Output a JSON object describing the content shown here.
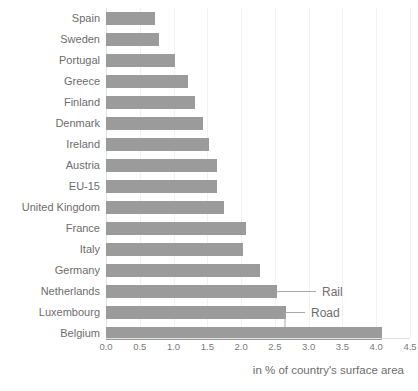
{
  "chart_data": {
    "type": "bar",
    "orientation": "horizontal",
    "title": "",
    "subtitle": "",
    "xlabel": "in % of country's surface area",
    "ylabel": "",
    "xlim": [
      0.0,
      4.5
    ],
    "x_ticks": [
      "0.0",
      "0.5",
      "1.0",
      "1.5",
      "2.0",
      "2.5",
      "3.0",
      "3.5",
      "4.0",
      "4.5"
    ],
    "x_tick_values": [
      0.0,
      0.5,
      1.0,
      1.5,
      2.0,
      2.5,
      3.0,
      3.5,
      4.0,
      4.5
    ],
    "grid": true,
    "grid_axis": "x",
    "legend_position": "inline-callout",
    "categories": [
      "Spain",
      "Sweden",
      "Portugal",
      "Greece",
      "Finland",
      "Denmark",
      "Ireland",
      "Austria",
      "EU-15",
      "United Kingdom",
      "France",
      "Italy",
      "Germany",
      "Netherlands",
      "Luxembourg",
      "Belgium"
    ],
    "values": [
      0.72,
      0.78,
      1.02,
      1.21,
      1.32,
      1.44,
      1.52,
      1.64,
      1.65,
      1.74,
      2.07,
      2.03,
      2.28,
      2.53,
      2.67,
      4.08
    ],
    "series": [
      {
        "name": "Road",
        "color": "#9b9b9b",
        "values": [
          0.72,
          0.78,
          1.02,
          1.21,
          1.32,
          1.44,
          1.52,
          1.64,
          1.65,
          1.74,
          2.07,
          2.03,
          2.28,
          2.53,
          2.67,
          4.08
        ]
      }
    ],
    "annotations": [
      {
        "text": "Rail",
        "target_category": "Netherlands"
      },
      {
        "text": "Road",
        "target_category": "Belgium"
      }
    ],
    "colors": {
      "bar": "#9b9b9b",
      "text": "#6d6d6d",
      "gridline": "#f2f2f2",
      "axis": "#e0e0e0",
      "background": "#ffffff"
    }
  }
}
